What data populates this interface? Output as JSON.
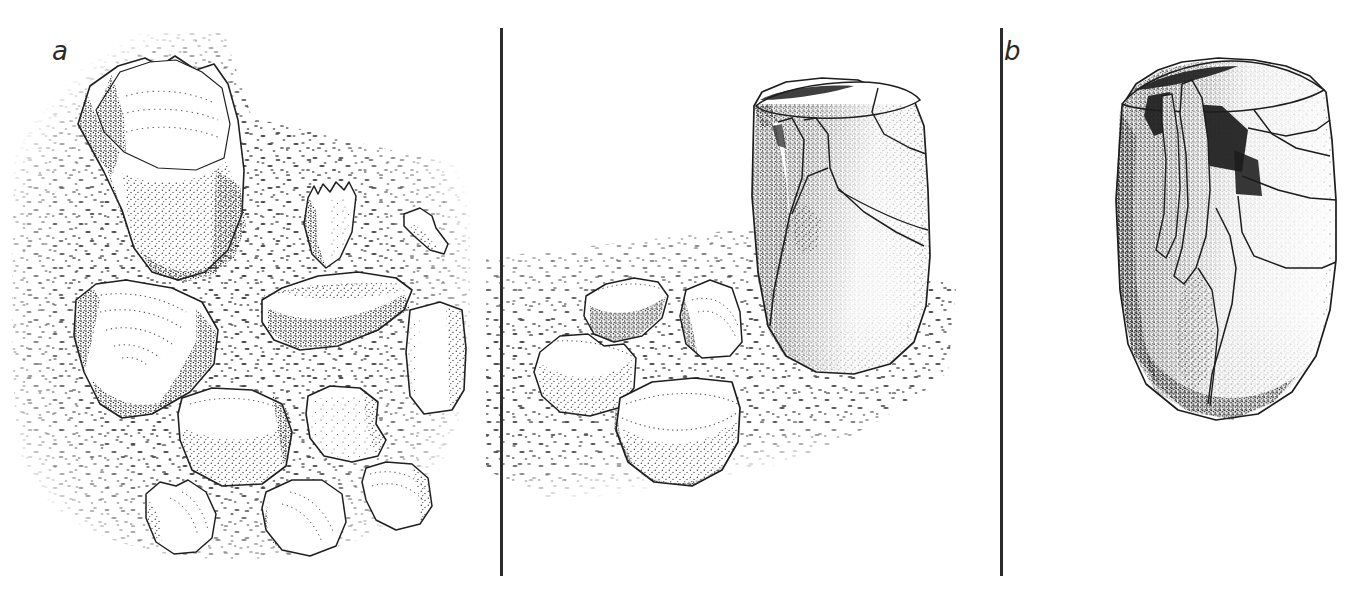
{
  "figure": {
    "type": "scientific-line-drawing",
    "medium": "pen-and-ink stipple illustration",
    "background_color": "#ffffff",
    "ink_color": "#2a2a2a",
    "width": 1366,
    "height": 594
  },
  "panels": [
    {
      "id": "a",
      "label": "a",
      "description": "Numerous fragments scattered across a stippled ground surface, with one large curved piece at upper left",
      "fragment_count": 11,
      "has_ground_stipple": true,
      "has_reconstructed_vessel": false
    },
    {
      "id": "b",
      "label": "b",
      "description": "Partially reassembled cylindrical vessel standing on the stippled ground with four remaining loose fragments to its left",
      "fragment_count": 4,
      "has_ground_stipple": true,
      "has_reconstructed_vessel": true
    },
    {
      "id": "c",
      "label": "c",
      "description": "Fully reassembled artefact shown isolated without ground stipple",
      "fragment_count": 0,
      "has_ground_stipple": false,
      "has_reconstructed_vessel": true
    }
  ],
  "dividers": [
    {
      "name": "divider-a-b",
      "x": 500,
      "y_top": 28,
      "y_bottom": 576,
      "color": "#2b2b2b"
    },
    {
      "name": "divider-b-c",
      "x": 1000,
      "y_top": 28,
      "y_bottom": 576,
      "color": "#2b2b2b"
    }
  ]
}
